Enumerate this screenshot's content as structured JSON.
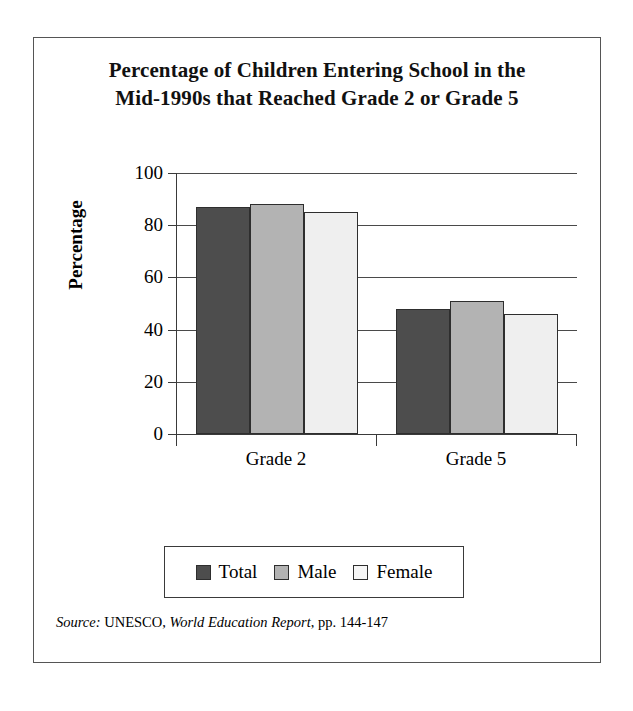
{
  "chart_data": {
    "type": "bar",
    "title": "Percentage of Children Entering School in the Mid-1990s that Reached Grade 2 or Grade 5",
    "title_line1": "Percentage of Children Entering School in the",
    "title_line2": "Mid-1990s that Reached Grade 2 or Grade 5",
    "categories": [
      "Grade 2",
      "Grade 5"
    ],
    "series": [
      {
        "name": "Total",
        "values": [
          87,
          48
        ],
        "color": "#4d4d4d"
      },
      {
        "name": "Male",
        "values": [
          88,
          51
        ],
        "color": "#b3b3b3"
      },
      {
        "name": "Female",
        "values": [
          85,
          46
        ],
        "color": "#efefef"
      }
    ],
    "xlabel": "",
    "ylabel": "Percentage",
    "ylim": [
      0,
      100
    ],
    "yticks": [
      0,
      20,
      40,
      60,
      80,
      100
    ],
    "ytick_labels": [
      "0",
      "20",
      "40",
      "60",
      "80",
      "100"
    ],
    "grid": true,
    "grid_axis": "y",
    "legend_position": "bottom",
    "legend_entries": [
      "Total",
      "Male",
      "Female"
    ]
  },
  "source": {
    "label": "Source:",
    "publisher": "UNESCO,",
    "publication": "World Education Report",
    "pages": ", pp. 144-147"
  }
}
